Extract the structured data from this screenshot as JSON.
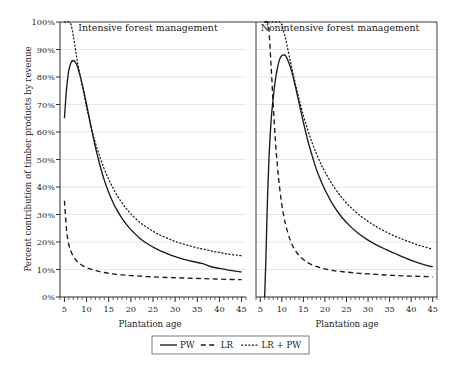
{
  "figure": {
    "ylabel": "Percent contribution of timber products by revenue",
    "xlabel_left": "Plantation age",
    "xlabel_right": "Plantation age",
    "background": "#ffffff",
    "ink": "#1a1a1a",
    "gridcolor": "#dcdcdc"
  },
  "legend": {
    "position": "below-axes-center",
    "entries": [
      {
        "label": "PW",
        "style": "solid"
      },
      {
        "label": "LR",
        "style": "dashed"
      },
      {
        "label": "LR + PW",
        "style": "dotted"
      }
    ]
  },
  "chart_data": [
    {
      "type": "line",
      "title": "Intensive forest management",
      "xlabel": "Plantation age",
      "ylabel": "Percent contribution of timber products by revenue",
      "xlim": [
        4,
        46
      ],
      "ylim": [
        0,
        100
      ],
      "xticks": [
        5,
        10,
        15,
        20,
        25,
        30,
        35,
        40,
        45
      ],
      "xtick_labels": [
        "5",
        "10",
        "15",
        "20",
        "25",
        "30",
        "35",
        "40",
        "45"
      ],
      "yticks": [
        0,
        10,
        20,
        30,
        40,
        50,
        60,
        70,
        80,
        90,
        100
      ],
      "ytick_labels": [
        "0%",
        "10%",
        "20%",
        "30%",
        "40%",
        "50%",
        "60%",
        "70%",
        "80%",
        "90%",
        "100%"
      ],
      "grid": "horizontal",
      "x": [
        5,
        5.5,
        6,
        6.5,
        7,
        7.5,
        8,
        9,
        10,
        11,
        12,
        13,
        14,
        15,
        16,
        17,
        18,
        19,
        20,
        22,
        24,
        26,
        28,
        30,
        32,
        34,
        36,
        38,
        40,
        42,
        44,
        45
      ],
      "series": [
        {
          "name": "PW",
          "style": "solid",
          "values": [
            65,
            76,
            82.5,
            85.3,
            86,
            85.3,
            83.5,
            77.5,
            70,
            62,
            54.5,
            48,
            42.5,
            38,
            34.3,
            31.2,
            28.6,
            26.4,
            24.5,
            21.4,
            19.1,
            17.3,
            15.9,
            14.7,
            13.7,
            12.9,
            12.2,
            11.1,
            10.4,
            9.8,
            9.3,
            9.1
          ]
        },
        {
          "name": "LR",
          "style": "dashed",
          "values": [
            35,
            24,
            19,
            16.5,
            14.8,
            13.6,
            12.7,
            11.5,
            10.7,
            10.1,
            9.6,
            9.2,
            8.9,
            8.6,
            8.4,
            8.2,
            8.05,
            7.9,
            7.8,
            7.6,
            7.4,
            7.25,
            7.1,
            7.0,
            6.9,
            6.8,
            6.7,
            6.6,
            6.5,
            6.4,
            6.35,
            6.3
          ]
        },
        {
          "name": "LR + PW",
          "style": "dotted",
          "values": [
            100,
            100,
            100,
            99,
            95,
            90,
            85,
            77,
            69,
            62,
            56,
            51,
            46.5,
            42.8,
            39.5,
            36.7,
            34.2,
            32.1,
            30.2,
            27.2,
            24.9,
            23.0,
            21.5,
            20.2,
            19.2,
            18.3,
            17.5,
            16.8,
            16.2,
            15.6,
            15.2,
            15.0
          ]
        }
      ]
    },
    {
      "type": "line",
      "title": "Nonintensive forest management",
      "xlabel": "Plantation age",
      "ylabel": "",
      "xlim": [
        4,
        46
      ],
      "ylim": [
        0,
        100
      ],
      "xticks": [
        5,
        10,
        15,
        20,
        25,
        30,
        35,
        40,
        45
      ],
      "xtick_labels": [
        "5",
        "10",
        "15",
        "20",
        "25",
        "30",
        "35",
        "40",
        "45"
      ],
      "yticks": [
        0,
        10,
        20,
        30,
        40,
        50,
        60,
        70,
        80,
        90,
        100
      ],
      "grid": "horizontal",
      "x": [
        6,
        6.3,
        6.6,
        7,
        7.5,
        8,
        8.5,
        9,
        9.5,
        10,
        10.5,
        11,
        12,
        13,
        14,
        15,
        16,
        17,
        18,
        19,
        20,
        22,
        24,
        26,
        28,
        30,
        32,
        34,
        36,
        38,
        40,
        42,
        44,
        45
      ],
      "series": [
        {
          "name": "PW",
          "style": "solid",
          "values": [
            0,
            14,
            32,
            50,
            64,
            72.5,
            79,
            83.5,
            86.5,
            87.8,
            88,
            87.4,
            83.5,
            77.5,
            70.5,
            63.5,
            57,
            51.5,
            46.5,
            42.5,
            39,
            33.2,
            28.8,
            25.5,
            22.8,
            20.7,
            18.9,
            17.4,
            16.0,
            14.6,
            13.3,
            12.2,
            11.3,
            11.0
          ]
        },
        {
          "name": "LR",
          "style": "dashed",
          "values": [
            100,
            100,
            100,
            97,
            84,
            70,
            57,
            47,
            39.5,
            33.5,
            29,
            25.5,
            20.4,
            17.2,
            15.1,
            13.6,
            12.5,
            11.7,
            11.1,
            10.6,
            10.2,
            9.6,
            9.2,
            8.9,
            8.6,
            8.4,
            8.2,
            8.0,
            7.85,
            7.7,
            7.6,
            7.5,
            7.4,
            7.35
          ]
        },
        {
          "name": "LR + PW",
          "style": "dotted",
          "values": [
            100,
            100,
            100,
            100,
            100,
            100,
            100,
            100,
            100,
            99,
            96,
            93,
            85.5,
            78.5,
            72,
            66,
            60.8,
            56.2,
            52.2,
            48.6,
            45.5,
            40.2,
            36.0,
            32.6,
            29.8,
            27.5,
            25.5,
            23.8,
            22.3,
            21.0,
            19.8,
            18.7,
            17.8,
            17.4
          ]
        }
      ]
    }
  ]
}
